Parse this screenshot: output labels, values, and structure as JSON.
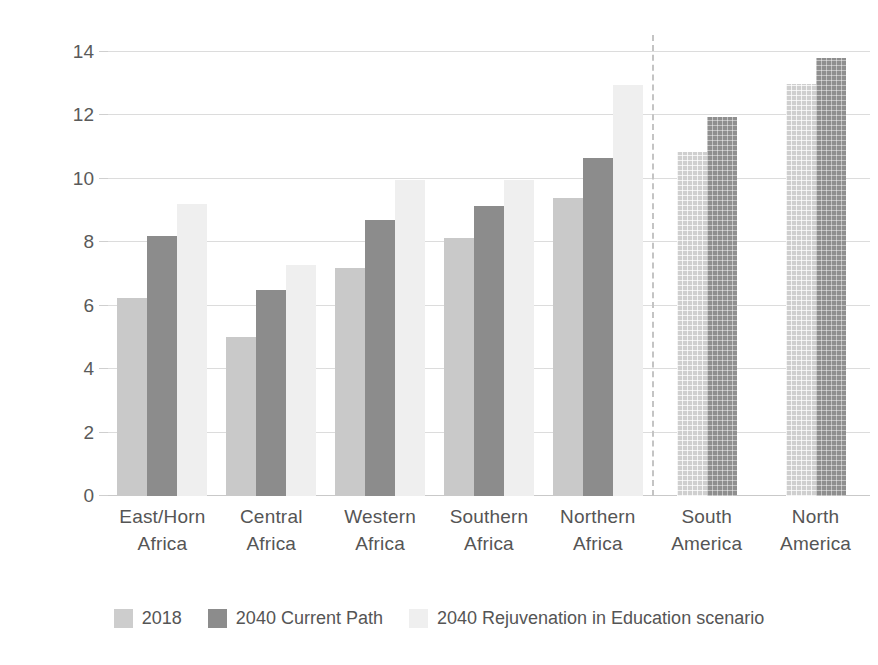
{
  "chart_data": {
    "type": "bar",
    "title": "",
    "xlabel": "",
    "ylabel": "Mean years of education",
    "ylim": [
      0,
      14
    ],
    "yticks": [
      0,
      2,
      4,
      6,
      8,
      10,
      12,
      14
    ],
    "ytick_labels": [
      "0",
      "2",
      "4",
      "6",
      "8",
      "10",
      "12",
      "14"
    ],
    "grid": true,
    "legend_position": "bottom",
    "categories": [
      "East/Horn Africa",
      "Central Africa",
      "Western Africa",
      "Southern Africa",
      "Northern Africa",
      "South America",
      "North America"
    ],
    "category_lines": [
      [
        "East/Horn",
        "Africa"
      ],
      [
        "Central",
        "Africa"
      ],
      [
        "Western",
        "Africa"
      ],
      [
        "Southern",
        "Africa"
      ],
      [
        "Northern",
        "Africa"
      ],
      [
        "South",
        "America"
      ],
      [
        "North",
        "America"
      ]
    ],
    "series": [
      {
        "name": "2018",
        "color": "#c9c9c9",
        "values": [
          6.25,
          5.0,
          7.2,
          8.15,
          9.4,
          10.85,
          13.0
        ]
      },
      {
        "name": "2040 Current Path",
        "color": "#8c8c8c",
        "values": [
          8.2,
          6.5,
          8.7,
          9.15,
          10.65,
          11.95,
          13.8
        ]
      },
      {
        "name": "2040 Rejuvenation in Education scenario",
        "color": "#efefef",
        "values": [
          9.2,
          7.3,
          9.95,
          9.95,
          12.95,
          null,
          null
        ]
      }
    ],
    "annotations": {
      "divider_after_category": "Northern Africa",
      "divider_style": "dashed vertical line separating African regions from the Americas"
    },
    "hatched_categories": [
      "South America",
      "North America"
    ]
  },
  "legend": {
    "items": [
      {
        "label": "2018",
        "swatch": "s2018"
      },
      {
        "label": "2040 Current Path",
        "swatch": "sCurrent"
      },
      {
        "label": "2040 Rejuvenation in Education scenario",
        "swatch": "sRejuv"
      }
    ]
  }
}
